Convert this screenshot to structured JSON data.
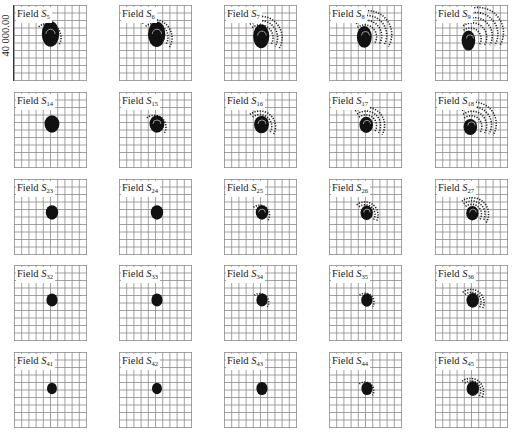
{
  "figure": {
    "y_axis_label": "40 000.00",
    "grid_divisions": 10,
    "panel_prefix": "Field ",
    "colors": {
      "grid": "#8a8a8a",
      "blob": "#111111",
      "ring": "#222222",
      "background": "#ffffff"
    }
  },
  "panels": [
    {
      "row": 0,
      "col": 0,
      "name": "S",
      "sub": "5",
      "cx": 0.5,
      "cy": 0.38,
      "core": 0.14,
      "rings": 1,
      "spread": 0.0
    },
    {
      "row": 0,
      "col": 1,
      "name": "S",
      "sub": "6",
      "cx": 0.52,
      "cy": 0.38,
      "core": 0.14,
      "rings": 2,
      "spread": 0.02
    },
    {
      "row": 0,
      "col": 2,
      "name": "S",
      "sub": "7",
      "cx": 0.52,
      "cy": 0.4,
      "core": 0.13,
      "rings": 3,
      "spread": 0.05
    },
    {
      "row": 0,
      "col": 3,
      "name": "S",
      "sub": "8",
      "cx": 0.5,
      "cy": 0.4,
      "core": 0.12,
      "rings": 4,
      "spread": 0.08
    },
    {
      "row": 0,
      "col": 4,
      "name": "S",
      "sub": "9",
      "cx": 0.48,
      "cy": 0.44,
      "core": 0.11,
      "rings": 5,
      "spread": 0.11
    },
    {
      "row": 1,
      "col": 0,
      "name": "S",
      "sub": "14",
      "cx": 0.52,
      "cy": 0.42,
      "core": 0.12,
      "rings": 0,
      "spread": 0.0
    },
    {
      "row": 1,
      "col": 1,
      "name": "S",
      "sub": "15",
      "cx": 0.52,
      "cy": 0.42,
      "core": 0.12,
      "rings": 1,
      "spread": 0.0
    },
    {
      "row": 1,
      "col": 2,
      "name": "S",
      "sub": "16",
      "cx": 0.52,
      "cy": 0.42,
      "core": 0.12,
      "rings": 2,
      "spread": 0.03
    },
    {
      "row": 1,
      "col": 3,
      "name": "S",
      "sub": "17",
      "cx": 0.52,
      "cy": 0.42,
      "core": 0.11,
      "rings": 3,
      "spread": 0.05
    },
    {
      "row": 1,
      "col": 4,
      "name": "S",
      "sub": "18",
      "cx": 0.5,
      "cy": 0.44,
      "core": 0.11,
      "rings": 4,
      "spread": 0.08
    },
    {
      "row": 2,
      "col": 0,
      "name": "S",
      "sub": "23",
      "cx": 0.52,
      "cy": 0.44,
      "core": 0.1,
      "rings": 0,
      "spread": 0.0
    },
    {
      "row": 2,
      "col": 1,
      "name": "S",
      "sub": "24",
      "cx": 0.52,
      "cy": 0.44,
      "core": 0.1,
      "rings": 0,
      "spread": 0.0
    },
    {
      "row": 2,
      "col": 2,
      "name": "S",
      "sub": "25",
      "cx": 0.52,
      "cy": 0.44,
      "core": 0.1,
      "rings": 1,
      "spread": 0.0
    },
    {
      "row": 2,
      "col": 3,
      "name": "S",
      "sub": "26",
      "cx": 0.52,
      "cy": 0.44,
      "core": 0.1,
      "rings": 2,
      "spread": 0.02
    },
    {
      "row": 2,
      "col": 4,
      "name": "S",
      "sub": "27",
      "cx": 0.52,
      "cy": 0.44,
      "core": 0.1,
      "rings": 3,
      "spread": 0.04
    },
    {
      "row": 3,
      "col": 0,
      "name": "S",
      "sub": "32",
      "cx": 0.52,
      "cy": 0.46,
      "core": 0.09,
      "rings": 0,
      "spread": 0.0
    },
    {
      "row": 3,
      "col": 1,
      "name": "S",
      "sub": "33",
      "cx": 0.52,
      "cy": 0.46,
      "core": 0.09,
      "rings": 0,
      "spread": 0.0
    },
    {
      "row": 3,
      "col": 2,
      "name": "S",
      "sub": "34",
      "cx": 0.52,
      "cy": 0.46,
      "core": 0.09,
      "rings": 1,
      "spread": 0.0
    },
    {
      "row": 3,
      "col": 3,
      "name": "S",
      "sub": "35",
      "cx": 0.52,
      "cy": 0.46,
      "core": 0.09,
      "rings": 1,
      "spread": 0.01
    },
    {
      "row": 3,
      "col": 4,
      "name": "S",
      "sub": "36",
      "cx": 0.52,
      "cy": 0.46,
      "core": 0.1,
      "rings": 2,
      "spread": 0.02
    },
    {
      "row": 4,
      "col": 0,
      "name": "S",
      "sub": "41",
      "cx": 0.52,
      "cy": 0.48,
      "core": 0.08,
      "rings": 0,
      "spread": 0.0
    },
    {
      "row": 4,
      "col": 1,
      "name": "S",
      "sub": "42",
      "cx": 0.52,
      "cy": 0.48,
      "core": 0.08,
      "rings": 0,
      "spread": 0.0
    },
    {
      "row": 4,
      "col": 2,
      "name": "S",
      "sub": "43",
      "cx": 0.52,
      "cy": 0.48,
      "core": 0.09,
      "rings": 0,
      "spread": 0.0
    },
    {
      "row": 4,
      "col": 3,
      "name": "S",
      "sub": "44",
      "cx": 0.52,
      "cy": 0.48,
      "core": 0.09,
      "rings": 1,
      "spread": 0.0
    },
    {
      "row": 4,
      "col": 4,
      "name": "S",
      "sub": "45",
      "cx": 0.52,
      "cy": 0.48,
      "core": 0.1,
      "rings": 2,
      "spread": 0.01
    }
  ],
  "layout": {
    "col_x": [
      14,
      119,
      224,
      329,
      435
    ],
    "row_y": [
      5,
      92,
      179,
      265,
      352
    ]
  }
}
